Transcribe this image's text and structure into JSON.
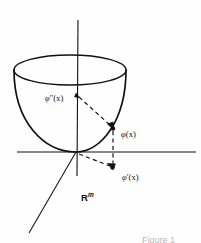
{
  "figure": {
    "domain_label": "R",
    "domain_superscript": "m",
    "caption": "Figure 1",
    "background_color": "#fefefe",
    "stroke_color": "#111111",
    "labels": [
      {
        "id": "phi-double-prime",
        "base": "φ",
        "prime": "′′",
        "arg": "(x)"
      },
      {
        "id": "phi",
        "base": "φ",
        "prime": "",
        "arg": "(x)"
      },
      {
        "id": "phi-prime",
        "base": "φ",
        "prime": "′",
        "arg": "(x)"
      }
    ],
    "geometry": {
      "origin": [
        76,
        152
      ],
      "vertical_axis": [
        [
          78,
          20
        ],
        [
          77,
          175
        ]
      ],
      "horizontal_axis": [
        [
          18,
          152
        ],
        [
          196,
          152
        ]
      ],
      "diagonal_axis": [
        [
          76,
          152
        ],
        [
          30,
          232
        ]
      ],
      "rim_ellipse": {
        "cx": 70,
        "cy": 70,
        "rx": 56,
        "ry": 15
      },
      "point_phi": [
        113,
        128
      ],
      "point_phi_prime": [
        113,
        168
      ],
      "dashed_from_rim": [
        [
          78,
          97
        ],
        [
          110,
          126
        ]
      ],
      "dashed_vertical": [
        [
          113,
          131
        ],
        [
          113,
          165
        ]
      ],
      "dashed_from_origin": [
        [
          78,
          154
        ],
        [
          110,
          166
        ]
      ]
    }
  }
}
